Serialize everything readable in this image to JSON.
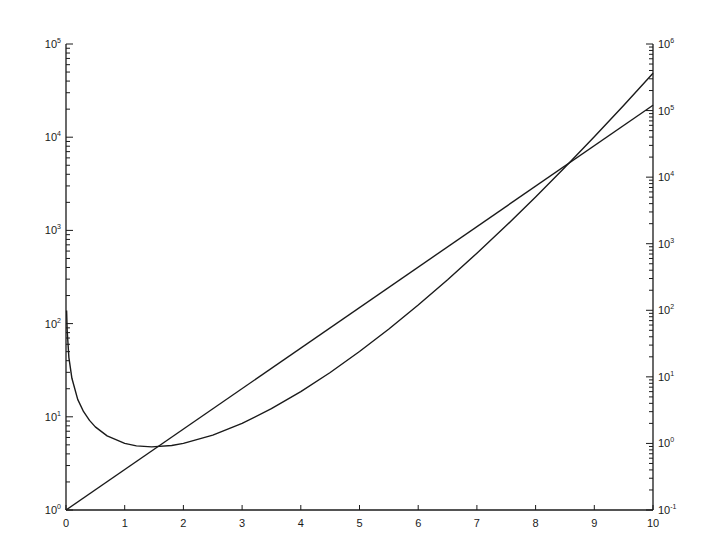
{
  "chart_data": {
    "type": "line",
    "title": "",
    "xlabel": "",
    "ylabel_left": "",
    "ylabel_right": "",
    "grid": false,
    "legend": null,
    "x_ticks": [
      "0",
      "1",
      "2",
      "3",
      "4",
      "5",
      "6",
      "7",
      "8",
      "9",
      "10"
    ],
    "xlim": [
      0,
      10
    ],
    "y_left": {
      "scale": "log",
      "ylim": [
        1,
        100000
      ],
      "ticks": [
        {
          "base": "10",
          "exp": "0"
        },
        {
          "base": "10",
          "exp": "1"
        },
        {
          "base": "10",
          "exp": "2"
        },
        {
          "base": "10",
          "exp": "3"
        },
        {
          "base": "10",
          "exp": "4"
        },
        {
          "base": "10",
          "exp": "5"
        }
      ]
    },
    "y_right": {
      "scale": "log",
      "ylim": [
        0.1,
        1000000
      ],
      "ticks": [
        {
          "base": "10",
          "exp": "-1"
        },
        {
          "base": "10",
          "exp": "0"
        },
        {
          "base": "10",
          "exp": "1"
        },
        {
          "base": "10",
          "exp": "2"
        },
        {
          "base": "10",
          "exp": "3"
        },
        {
          "base": "10",
          "exp": "4"
        },
        {
          "base": "10",
          "exp": "5"
        },
        {
          "base": "10",
          "exp": "6"
        }
      ]
    },
    "series": [
      {
        "name": "exp(x)",
        "axis": "left",
        "x": [
          0,
          10
        ],
        "values": [
          1,
          22026
        ]
      },
      {
        "name": "gamma(x)",
        "axis": "right",
        "x": [
          0.01,
          0.02,
          0.05,
          0.1,
          0.2,
          0.3,
          0.4,
          0.5,
          0.7,
          1,
          1.2,
          1.46,
          1.8,
          2,
          2.5,
          3,
          3.5,
          4,
          4.5,
          5,
          5.5,
          6,
          6.5,
          7,
          7.5,
          8,
          8.5,
          9,
          9.5,
          10
        ],
        "values": [
          99.43,
          49.44,
          19.47,
          9.514,
          4.591,
          2.992,
          2.218,
          1.772,
          1.298,
          1,
          0.918,
          0.8856,
          0.9314,
          1,
          1.329,
          2,
          3.323,
          6,
          11.63,
          24,
          52.34,
          120,
          287.9,
          720,
          1871,
          5040,
          14034,
          40320,
          119292,
          362880
        ]
      }
    ],
    "color": "#1a1a1a"
  }
}
